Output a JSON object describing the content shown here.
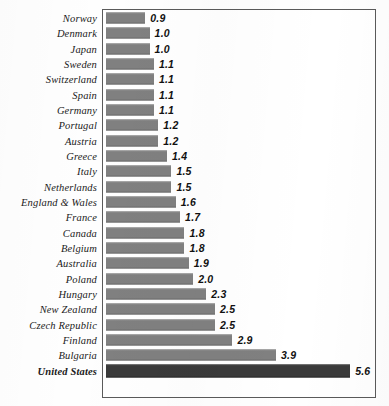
{
  "chart_data": {
    "type": "bar",
    "orientation": "horizontal",
    "title": "",
    "subtitle": "",
    "xlabel": "",
    "ylabel": "",
    "grid": false,
    "legend": "none",
    "xlim": [
      0,
      6.3
    ],
    "categories": [
      "Norway",
      "Denmark",
      "Japan",
      "Sweden",
      "Switzerland",
      "Spain",
      "Germany",
      "Portugal",
      "Austria",
      "Greece",
      "Italy",
      "Netherlands",
      "England & Wales",
      "France",
      "Canada",
      "Belgium",
      "Australia",
      "Poland",
      "Hungary",
      "New Zealand",
      "Czech Republic",
      "Finland",
      "Bulgaria",
      "United States"
    ],
    "values": [
      0.9,
      1.0,
      1.0,
      1.1,
      1.1,
      1.1,
      1.1,
      1.2,
      1.2,
      1.4,
      1.5,
      1.5,
      1.6,
      1.7,
      1.8,
      1.8,
      1.9,
      2.0,
      2.3,
      2.5,
      2.5,
      2.9,
      3.9,
      5.6
    ],
    "value_labels": [
      "0.9",
      "1.0",
      "1.0",
      "1.1",
      "1.1",
      "1.1",
      "1.1",
      "1.2",
      "1.2",
      "1.4",
      "1.5",
      "1.5",
      "1.6",
      "1.7",
      "1.8",
      "1.8",
      "1.9",
      "2.0",
      "2.3",
      "2.5",
      "2.5",
      "2.9",
      "3.9",
      "5.6"
    ],
    "highlighted_category": "United States",
    "bar_color": "#808080",
    "highlight_bar_color": "#3a3a3a",
    "frame_color": "#5a5a5a",
    "background_color": "#ffffff"
  }
}
